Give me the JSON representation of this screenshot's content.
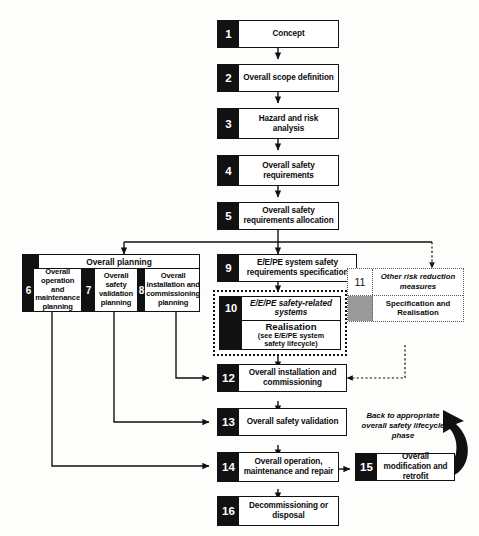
{
  "diagram": {
    "title": "Overall safety lifecycle",
    "type": "flowchart",
    "planning_group": {
      "header_label": "Overall planning",
      "sub_phases": [
        {
          "number": "6",
          "label": "Overall operation and maintenance planning"
        },
        {
          "number": "7",
          "label": "Overall safety validation planning"
        },
        {
          "number": "8",
          "label": "Overall installation and commissioning planning"
        }
      ]
    },
    "phases": [
      {
        "number": "1",
        "label": "Concept"
      },
      {
        "number": "2",
        "label": "Overall scope definition"
      },
      {
        "number": "3",
        "label": "Hazard and risk analysis"
      },
      {
        "number": "4",
        "label": "Overall safety requirements"
      },
      {
        "number": "5",
        "label": "Overall safety requirements allocation"
      },
      {
        "number": "9",
        "label": "E/E/PE system safety requirements specification"
      },
      {
        "number": "12",
        "label": "Overall installation and commissioning"
      },
      {
        "number": "13",
        "label": "Overall safety validation"
      },
      {
        "number": "14",
        "label": "Overall operation, maintenance and repair"
      },
      {
        "number": "15",
        "label": "Overall modification and retrofit"
      },
      {
        "number": "16",
        "label": "Decommissioning or disposal"
      }
    ],
    "realisation_box": {
      "number": "10",
      "title": "E/E/PE safety-related systems",
      "subtitle": "Realisation",
      "note": "(see E/E/PE system safety lifecycle)",
      "note_line1": "(see E/E/PE system",
      "note_line2": "safety lifecycle)"
    },
    "other_risk_box": {
      "number": "11",
      "title": "Other risk reduction measures",
      "subtitle": "Specification and Realisation"
    },
    "annotations": {
      "back_to_phase": "Back to appropriate overall safety lifecycle phase",
      "back_line1": "Back to appropriate",
      "back_line2": "overall safety lifecycle",
      "back_line3": "phase"
    },
    "colors": {
      "ink": "#111111",
      "paper": "#fdfdfb",
      "grey_block": "#9a9a9a",
      "dotted": "#5a5a5a"
    }
  }
}
